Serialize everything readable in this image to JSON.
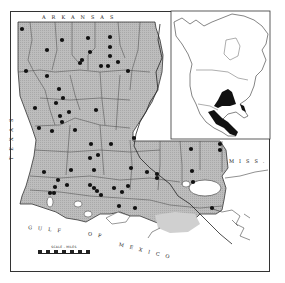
{
  "map": {
    "title": "",
    "region": "Louisiana",
    "labels": {
      "north": "ARKANSAS",
      "west": "TEXAS",
      "east": "MISS.",
      "gulf_word1": "GULF",
      "gulf_word2": "OF",
      "gulf_word3": "MEXICO"
    },
    "scale": {
      "title": "SCALE - MILES"
    },
    "colors": {
      "land_fill": "#b8b8b8",
      "parish_lines": "#444444",
      "dots": "#111111",
      "inset_range": "#111111",
      "water": "#ffffff"
    },
    "occurrence_points": [
      [
        22,
        29
      ],
      [
        62,
        40
      ],
      [
        47,
        50
      ],
      [
        88,
        38
      ],
      [
        90,
        52
      ],
      [
        80,
        63
      ],
      [
        82,
        60
      ],
      [
        110,
        37
      ],
      [
        110,
        47
      ],
      [
        110,
        56
      ],
      [
        101,
        66
      ],
      [
        108,
        66
      ],
      [
        118,
        62
      ],
      [
        128,
        71
      ],
      [
        26,
        71
      ],
      [
        47,
        76
      ],
      [
        59,
        89
      ],
      [
        63,
        98
      ],
      [
        56,
        103
      ],
      [
        69,
        112
      ],
      [
        60,
        116
      ],
      [
        62,
        122
      ],
      [
        35,
        108
      ],
      [
        96,
        110
      ],
      [
        39,
        128
      ],
      [
        52,
        131
      ],
      [
        75,
        130
      ],
      [
        134,
        138
      ],
      [
        91,
        144
      ],
      [
        111,
        144
      ],
      [
        98,
        155
      ],
      [
        90,
        158
      ],
      [
        94,
        170
      ],
      [
        71,
        170
      ],
      [
        44,
        172
      ],
      [
        58,
        180
      ],
      [
        55,
        187
      ],
      [
        67,
        185
      ],
      [
        50,
        193
      ],
      [
        54,
        193
      ],
      [
        90,
        185
      ],
      [
        94,
        188
      ],
      [
        97,
        191
      ],
      [
        101,
        195
      ],
      [
        114,
        188
      ],
      [
        122,
        192
      ],
      [
        128,
        186
      ],
      [
        131,
        168
      ],
      [
        147,
        172
      ],
      [
        157,
        174
      ],
      [
        157,
        178
      ],
      [
        191,
        149
      ],
      [
        192,
        171
      ],
      [
        193,
        182
      ],
      [
        220,
        144
      ],
      [
        220,
        150
      ],
      [
        119,
        206
      ],
      [
        135,
        208
      ],
      [
        212,
        208
      ]
    ],
    "inset": {
      "region": "North America",
      "description": "Range shown in black: south-central United States and Mexico"
    }
  }
}
